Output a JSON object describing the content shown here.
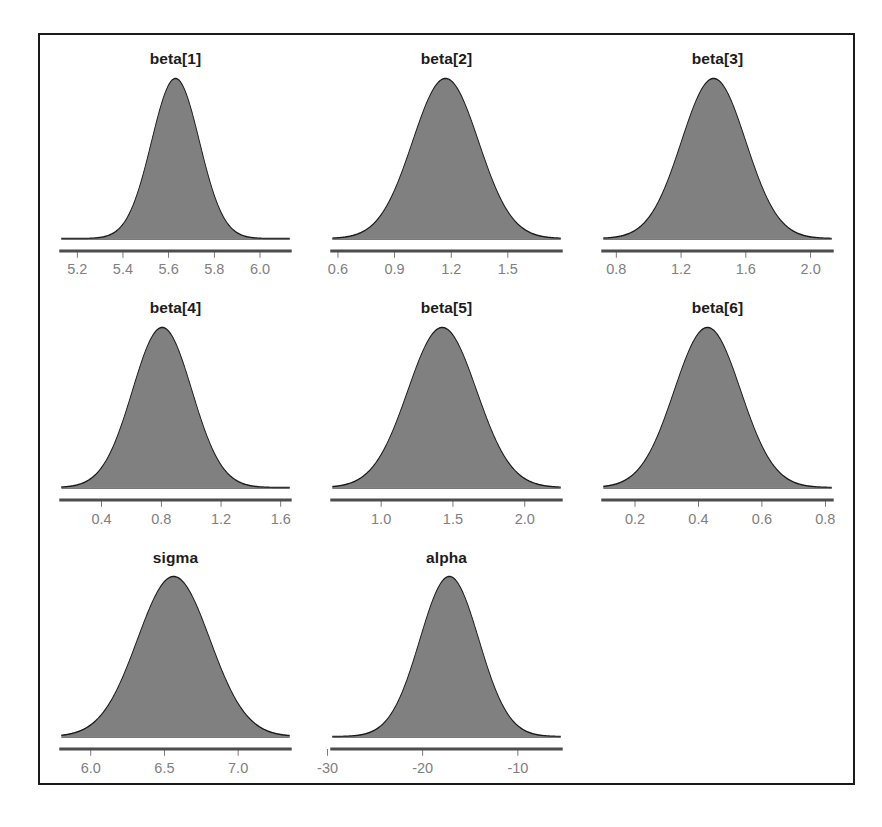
{
  "figure": {
    "kind": "posterior-density-grid",
    "columns": 3,
    "rows": 3,
    "frame_color": "#1a1a1a",
    "background_color": "#ffffff"
  },
  "style": {
    "density_fill": "#808080",
    "density_stroke": "#1a1a1a",
    "axis_line_color": "#4d4d4d",
    "baseline_color": "#4d4d4d",
    "tick_label_color": "#808080",
    "title_color": "#1c1c1c"
  },
  "chart_data": {
    "type": "area",
    "title": "",
    "subtitle": "",
    "xlabel": "",
    "ylabel": "",
    "grid": false,
    "legend": "none",
    "panels": [
      {
        "name": "beta[1]",
        "title": "beta[1]",
        "mean": 5.63,
        "sd": 0.105,
        "skew": 0.0,
        "peak_x": 5.63,
        "xlim": [
          5.13,
          6.13
        ],
        "ticks": [
          5.2,
          5.4,
          5.6,
          5.8,
          6.0
        ],
        "tick_labels": [
          "5.2",
          "5.4",
          "5.6",
          "5.8",
          "6.0"
        ]
      },
      {
        "name": "beta[2]",
        "title": "beta[2]",
        "mean": 1.17,
        "sd": 0.175,
        "skew": 0.0,
        "peak_x": 1.17,
        "xlim": [
          0.57,
          1.78
        ],
        "ticks": [
          0.6,
          0.9,
          1.2,
          1.5
        ],
        "tick_labels": [
          "0.6",
          "0.9",
          "1.2",
          "1.5"
        ]
      },
      {
        "name": "beta[3]",
        "title": "beta[3]",
        "mean": 1.42,
        "sd": 0.2,
        "skew": -0.12,
        "peak_x": 1.45,
        "xlim": [
          0.72,
          2.13
        ],
        "ticks": [
          0.8,
          1.2,
          1.6,
          2.0
        ],
        "tick_labels": [
          "0.8",
          "1.2",
          "1.6",
          "2.0"
        ]
      },
      {
        "name": "beta[4]",
        "title": "beta[4]",
        "mean": 0.79,
        "sd": 0.2,
        "skew": 0.1,
        "peak_x": 0.77,
        "xlim": [
          0.13,
          1.66
        ],
        "ticks": [
          0.4,
          0.8,
          1.2,
          1.6
        ],
        "tick_labels": [
          "0.4",
          "0.8",
          "1.2",
          "1.6"
        ]
      },
      {
        "name": "beta[5]",
        "title": "beta[5]",
        "mean": 1.41,
        "sd": 0.24,
        "skew": 0.08,
        "peak_x": 1.39,
        "xlim": [
          0.66,
          2.25
        ],
        "ticks": [
          1.0,
          1.5,
          2.0
        ],
        "tick_labels": [
          "1.0",
          "1.5",
          "2.0"
        ]
      },
      {
        "name": "beta[6]",
        "title": "beta[6]",
        "mean": 0.435,
        "sd": 0.105,
        "skew": -0.08,
        "peak_x": 0.45,
        "xlim": [
          0.1,
          0.82
        ],
        "ticks": [
          0.2,
          0.4,
          0.6,
          0.8
        ],
        "tick_labels": [
          "0.2",
          "0.4",
          "0.6",
          "0.8"
        ]
      },
      {
        "name": "sigma",
        "title": "sigma",
        "mean": 6.52,
        "sd": 0.25,
        "skew": 0.22,
        "peak_x": 6.48,
        "xlim": [
          5.8,
          7.35
        ],
        "ticks": [
          6.0,
          6.5,
          7.0
        ],
        "tick_labels": [
          "6.0",
          "6.5",
          "7.0"
        ]
      },
      {
        "name": "alpha",
        "title": "alpha",
        "mean": -17.2,
        "sd": 3.1,
        "skew": 0.0,
        "peak_x": -17.2,
        "xlim": [
          -29.5,
          -5.5
        ],
        "ticks": [
          -30,
          -20,
          -10
        ],
        "tick_labels": [
          "-30",
          "-20",
          "-10"
        ]
      }
    ]
  }
}
